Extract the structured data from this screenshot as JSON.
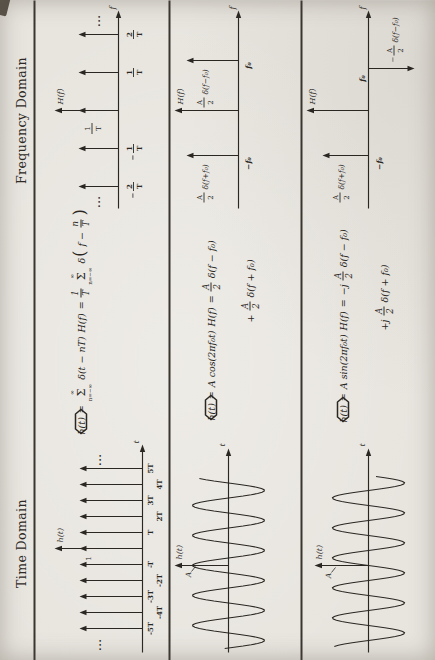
{
  "page": {
    "background": "#e8e5df",
    "ink": "#2a2723"
  },
  "headings": {
    "time": "Time Domain",
    "frequency": "Frequency Domain"
  },
  "rows": [
    {
      "label": "impulse-train-pair",
      "time_plot": {
        "ylabel": "h(t)",
        "xlabel": "t",
        "height_label": "1",
        "ellipsis": "···",
        "ticks": [
          "-5T",
          "-4T",
          "-3T",
          "-2T",
          "-T",
          "T",
          "2T",
          "3T",
          "4T",
          "5T"
        ]
      },
      "equation": {
        "lhs": "h(t)",
        "eq": "=",
        "sum_upper": "∞",
        "sigma": "Σ",
        "sum_lower": "n=−∞",
        "rhs": "δ(t − nT)",
        "H_lhs": "H(f)",
        "H_eq": "=",
        "coef": {
          "num": "1",
          "den": "T"
        },
        "sum2_upper": "∞",
        "sigma2": "Σ",
        "sum2_lower": "n=−∞",
        "delta": "δ",
        "popen": "(",
        "inner_pre": "f −",
        "inner": {
          "num": "n",
          "den": "T"
        },
        "pclose": ")"
      },
      "freq_plot": {
        "ylabel": "H(f)",
        "xlabel": "f",
        "ellipsis": "···",
        "amplitude": {
          "num": "1",
          "den": "T"
        },
        "ticks": [
          {
            "sign": "−",
            "num": "2",
            "den": "T"
          },
          {
            "sign": "−",
            "num": "1",
            "den": "T"
          },
          {
            "sign": "",
            "num": "1",
            "den": "T"
          },
          {
            "sign": "",
            "num": "2",
            "den": "T"
          }
        ]
      }
    },
    {
      "label": "cosine-pair",
      "time_plot": {
        "ylabel": "h(t)",
        "xlabel": "t",
        "amplitude_label": "A"
      },
      "equation": {
        "lhs": "h(t)",
        "eq": "=",
        "rhs": "A cos(2πf₀t)",
        "H_lhs": "H(f)",
        "H_eq": "=",
        "frac1": {
          "num": "A",
          "den": "2"
        },
        "term1": "δ(f − f₀)",
        "line2_plus": "+",
        "frac2": {
          "num": "A",
          "den": "2"
        },
        "term2": "δ(f + f₀)"
      },
      "freq_plot": {
        "ylabel": "H(f)",
        "xlabel": "f",
        "neg": {
          "frac": {
            "num": "A",
            "den": "2"
          },
          "delta": "δ(f+f₀)",
          "tick": "−f₀"
        },
        "pos": {
          "frac": {
            "num": "A",
            "den": "2"
          },
          "delta": "δ(f−f₀)",
          "tick": "f₀"
        }
      }
    },
    {
      "label": "sine-pair",
      "time_plot": {
        "ylabel": "h(t)",
        "xlabel": "t",
        "amplitude_label": "A"
      },
      "equation": {
        "lhs": "h(t)",
        "eq": "=",
        "rhs": "A sin(2πf₀t)",
        "H_lhs": "H(f)",
        "H_eq": "=",
        "pre": "−j",
        "frac1": {
          "num": "A",
          "den": "2"
        },
        "term1": "δ(f − f₀)",
        "line2_plus": "+j",
        "frac2": {
          "num": "A",
          "den": "2"
        },
        "term2": "δ(f + f₀)"
      },
      "freq_plot": {
        "ylabel": "H(f)",
        "xlabel": "f",
        "neg": {
          "frac": {
            "num": "A",
            "den": "2"
          },
          "delta": "δ(f+f₀)",
          "tick": "−f₀"
        },
        "pos": {
          "sign": "−",
          "frac": {
            "num": "A",
            "den": "2"
          },
          "delta": "δ(f−f₀)",
          "tick": "f₀"
        }
      }
    }
  ]
}
